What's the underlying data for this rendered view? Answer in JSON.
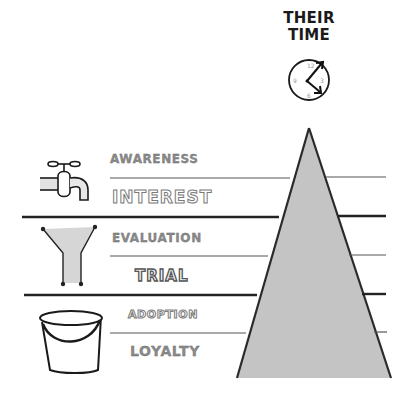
{
  "title": {
    "line1": "THEIR",
    "line2": "TIME"
  },
  "clock": {
    "numerals": [
      "12",
      "3",
      "6",
      "9"
    ],
    "icon": "clock-icon"
  },
  "stages": [
    {
      "label": "AWARENESS",
      "group": "tap"
    },
    {
      "label": "INTEREST",
      "group": "tap"
    },
    {
      "label": "EVALUATION",
      "group": "funnel"
    },
    {
      "label": "TRIAL",
      "group": "funnel"
    },
    {
      "label": "ADOPTION",
      "group": "bucket"
    },
    {
      "label": "LOYALTY",
      "group": "bucket"
    }
  ],
  "groups": [
    {
      "name": "tap",
      "icon": "tap-icon"
    },
    {
      "name": "funnel",
      "icon": "funnel-icon"
    },
    {
      "name": "bucket",
      "icon": "bucket-icon"
    }
  ],
  "colors": {
    "triangle_fill": "#c4c4c4",
    "line": "#2a2a2a",
    "label_outline": "#7a7a7a"
  }
}
